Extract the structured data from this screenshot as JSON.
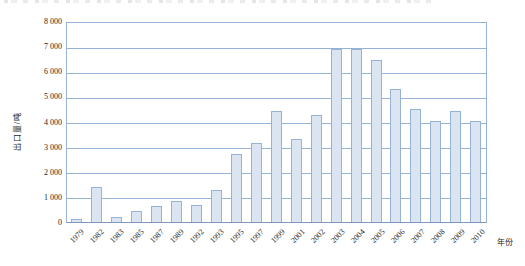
{
  "page": {
    "cropped_text_remnant": "illegible partial line of text cut off at the top edge of the screenshot"
  },
  "chart_data": {
    "type": "bar",
    "title": "",
    "ylabel": "出口量/吨",
    "xlabel": "年份",
    "categories": [
      "1979",
      "1982",
      "1983",
      "1985",
      "1987",
      "1989",
      "1992",
      "1993",
      "1995",
      "1997",
      "1999",
      "2001",
      "2002",
      "2003",
      "2004",
      "2005",
      "2006",
      "2007",
      "2008",
      "2009",
      "2010"
    ],
    "values": [
      100,
      1400,
      180,
      440,
      620,
      820,
      690,
      1260,
      2700,
      3150,
      4400,
      3300,
      4250,
      6900,
      6880,
      6450,
      5300,
      4500,
      4000,
      4400,
      4000
    ],
    "ylim": [
      0,
      8000
    ],
    "ytick_interval": 1000,
    "ytick_labels": [
      "8 000",
      "7 000",
      "6 000",
      "5 000",
      "4 000",
      "3 000",
      "2 000",
      "1 000",
      "0"
    ],
    "grid": true,
    "legend_position": "none",
    "colors": {
      "bar_fill": "#dbe5f1",
      "bar_border": "#95b3d7",
      "gridline": "#95b3d7",
      "axis": "#7e97bf",
      "text": "#1f1f1f"
    }
  }
}
